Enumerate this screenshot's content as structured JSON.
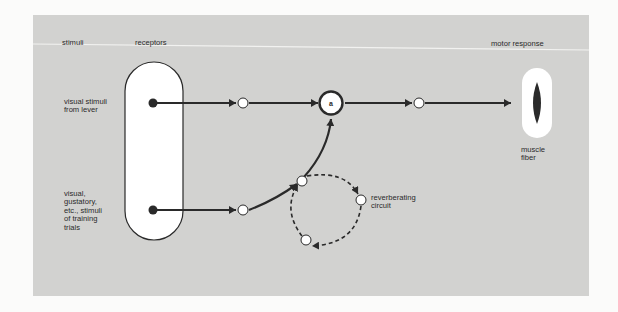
{
  "headers": {
    "stimuli": "stimuli",
    "receptors": "receptors",
    "motor_response": "motor response"
  },
  "stimuli": {
    "top_line1": "visual stimuli",
    "top_line2": "from lever",
    "bottom_lines": [
      "visual,",
      "gustatory,",
      "etc., stimuli",
      "of training",
      "trials"
    ]
  },
  "nodes": {
    "association_label": "a"
  },
  "circuit": {
    "line1": "reverberating",
    "line2": "circuit"
  },
  "effector": {
    "line1": "muscle",
    "line2": "fiber"
  },
  "colors": {
    "panel": "#d2d2d0",
    "ink": "#2a2a2a",
    "white": "#ffffff"
  }
}
